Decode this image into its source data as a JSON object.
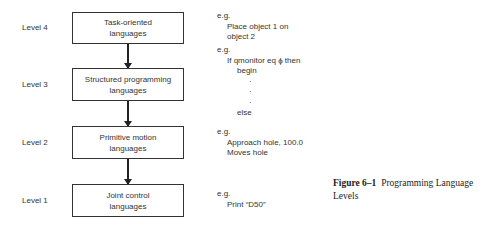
{
  "diagram": {
    "levels": [
      {
        "label": "Level 4",
        "box": [
          "Task-oriented",
          "languages"
        ]
      },
      {
        "label": "Level 3",
        "box": [
          "Structured programming",
          "languages"
        ]
      },
      {
        "label": "Level 2",
        "box": [
          "Primitive motion",
          "languages"
        ]
      },
      {
        "label": "Level 1",
        "box": [
          "Joint control",
          "languages"
        ]
      }
    ],
    "examples": [
      {
        "prefix": "e.g.",
        "lines": [
          "Place object 1 on",
          "object 2"
        ]
      },
      {
        "prefix": "e.g.",
        "lines": [
          "If qmonitor eq ϕ then",
          "begin",
          "·",
          "·",
          "·",
          "else"
        ]
      },
      {
        "prefix": "e.g.",
        "lines": [
          "Approach hole, 100.0",
          "Moves hole"
        ]
      },
      {
        "prefix": "e.g.",
        "lines": [
          "Print “D50”"
        ]
      }
    ],
    "caption": {
      "figure": "Figure 6–1",
      "title": "Programming Language Levels"
    }
  }
}
